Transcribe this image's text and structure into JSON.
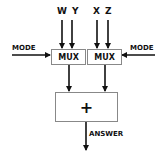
{
  "diagram": {
    "inputs": {
      "group_left": "W Y",
      "group_right": "X Z"
    },
    "mode_left": "MODE",
    "mode_right": "MODE",
    "mux_left": "MUX",
    "mux_right": "MUX",
    "adder": "+",
    "output": "ANSWER",
    "colors": {
      "line": "#111111",
      "box_border": "#888888"
    }
  }
}
